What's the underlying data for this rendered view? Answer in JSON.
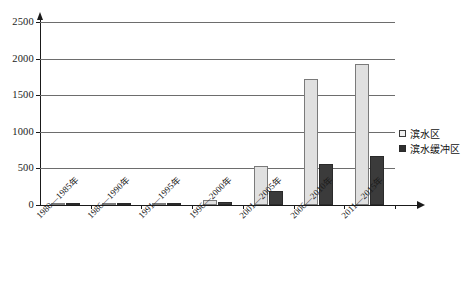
{
  "chart_data": {
    "type": "bar",
    "title": "",
    "subtitle": "",
    "xlabel": "",
    "ylabel": "",
    "ylim": [
      0,
      2500
    ],
    "ytick_step": 500,
    "yticks": [
      0,
      500,
      1000,
      1500,
      2000,
      2500
    ],
    "ytick_labels": [
      "0",
      "500",
      "1000",
      "1500",
      "2000",
      "2500"
    ],
    "grid": true,
    "grid_axis": "y",
    "legend_position": "right",
    "categories": [
      "1980—1985年",
      "1986—1990年",
      "1991—1995年",
      "1996—2000年",
      "2001—2005年",
      "2006—2010年",
      "2011—2015年"
    ],
    "series": [
      {
        "name": "滨水区",
        "color": "#e0e0e0",
        "values": [
          8,
          6,
          14,
          70,
          535,
          1715,
          1930
        ]
      },
      {
        "name": "滨水缓冲区",
        "color": "#3b3b3b",
        "values": [
          5,
          4,
          9,
          45,
          195,
          560,
          665
        ]
      }
    ]
  },
  "legend": {
    "items": [
      {
        "label": "滨水区",
        "swatch": "light"
      },
      {
        "label": "滨水缓冲区",
        "swatch": "dark"
      }
    ]
  },
  "axes": {
    "y": {
      "max_label": "2500",
      "ticks": [
        "2500",
        "2000",
        "1500",
        "1000",
        "500",
        "0"
      ]
    }
  }
}
